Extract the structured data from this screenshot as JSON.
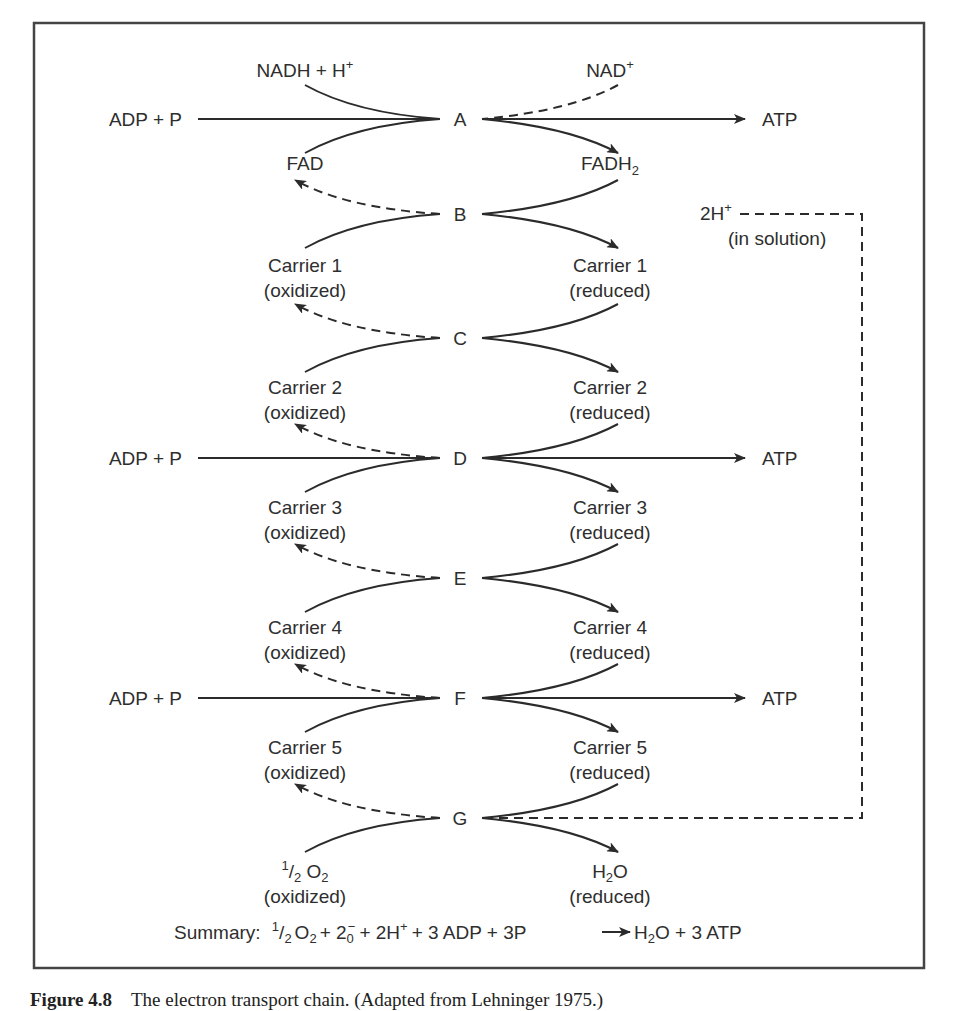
{
  "diagram": {
    "nodes": [
      {
        "id": "A",
        "y": 119
      },
      {
        "id": "B",
        "y": 214
      },
      {
        "id": "C",
        "y": 338
      },
      {
        "id": "D",
        "y": 458
      },
      {
        "id": "E",
        "y": 578
      },
      {
        "id": "F",
        "y": 698
      },
      {
        "id": "G",
        "y": 818
      }
    ],
    "top_inputs": {
      "left": "NADH + H",
      "left_sup": "+",
      "right": "NAD",
      "right_sup": "+"
    },
    "pairs": [
      {
        "left_1": "FAD",
        "left_2": "",
        "right_1": "FADH",
        "right_1_sub": "2",
        "right_2": ""
      },
      {
        "left_1": "Carrier 1",
        "left_2": "(oxidized)",
        "right_1": "Carrier 1",
        "right_2": "(reduced)"
      },
      {
        "left_1": "Carrier 2",
        "left_2": "(oxidized)",
        "right_1": "Carrier 2",
        "right_2": "(reduced)"
      },
      {
        "left_1": "Carrier 3",
        "left_2": "(oxidized)",
        "right_1": "Carrier 3",
        "right_2": "(reduced)"
      },
      {
        "left_1": "Carrier 4",
        "left_2": "(oxidized)",
        "right_1": "Carrier 4",
        "right_2": "(reduced)"
      },
      {
        "left_1": "Carrier 5",
        "left_2": "(oxidized)",
        "right_1": "Carrier 5",
        "right_2": "(reduced)"
      }
    ],
    "final": {
      "left_frac_num": "1",
      "left_frac_den": "2",
      "left_main": " O",
      "left_sub": "2",
      "left_2": "(oxidized)",
      "right_main": "H",
      "right_sub": "2",
      "right_tail": "O",
      "right_2": "(reduced)"
    },
    "atp_rows": [
      {
        "node": "A",
        "input": "ADP + P",
        "output": "ATP"
      },
      {
        "node": "D",
        "input": "ADP + P",
        "output": "ATP"
      },
      {
        "node": "F",
        "input": "ADP + P",
        "output": "ATP"
      }
    ],
    "proton": {
      "label": "2H",
      "label_sup": "+",
      "note": "(in solution)"
    },
    "summary": {
      "prefix": "Summary:",
      "half_num": "1",
      "half_den": "2",
      "o2": "O",
      "o2_sub": "2",
      "plus1": "+ 2",
      "e_sub": "0",
      "e_sup": "−",
      "rest1": "+ 2H",
      "rest1_sup": "+",
      "rest2": "+ 3 ADP + 3P",
      "product_h": "H",
      "product_sub": "2",
      "product_tail": "O + 3 ATP"
    }
  },
  "caption": {
    "label": "Figure 4.8",
    "text": "The electron transport chain. (Adapted from Lehninger 1975.)"
  }
}
